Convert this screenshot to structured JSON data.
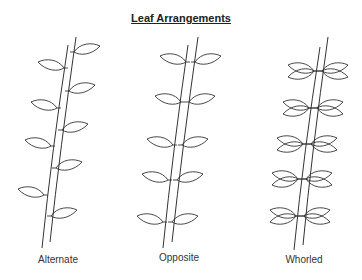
{
  "title": "Leaf Arrangements",
  "panels": [
    {
      "id": "alternate",
      "label": "Alternate",
      "label_x": 18
    },
    {
      "id": "opposite",
      "label": "Opposite",
      "label_x": 139
    },
    {
      "id": "whorled",
      "label": "Whorled",
      "label_x": 264
    }
  ],
  "colors": {
    "line": "#333333",
    "background": "#ffffff"
  }
}
